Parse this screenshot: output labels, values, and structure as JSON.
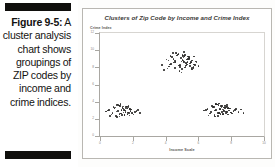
{
  "figure": {
    "label": "Figure 9-5:",
    "caption": "A cluster analysis chart shows groupings of ZIP codes by income and crime indices."
  },
  "colors": {
    "rule": "#100f0d",
    "point": "#2b2a28",
    "axis": "#a9a7a2",
    "panel_border": "#b9b7b2",
    "title_text": "#3b3a38",
    "tick_text": "#8a8884"
  },
  "chart_data": {
    "type": "scatter",
    "title": "Clusters of Zip Code by Income and Crime Index",
    "xlabel": "Income Scale",
    "ylabel": "Crime Index",
    "grid": false,
    "legend": "none",
    "xlim": [
      0,
      10
    ],
    "ylim": [
      0,
      12
    ],
    "xticks": [
      0,
      2,
      4,
      6,
      8,
      10
    ],
    "yticks": [
      0,
      2,
      4,
      6,
      8,
      10,
      12
    ],
    "xticklabels": [
      "0",
      "2",
      "4",
      "6",
      "8",
      "10"
    ],
    "yticklabels": [
      "0",
      "2",
      "4",
      "6",
      "8",
      "10",
      "12"
    ],
    "series": [
      {
        "name": "Cluster A (high crime, mid income)",
        "x": [
          4.05,
          4.3,
          4.52,
          4.66,
          4.8,
          4.95,
          5.08,
          5.2,
          5.32,
          5.44,
          4.2,
          4.4,
          4.6,
          4.74,
          4.88,
          5.02,
          5.16,
          5.28,
          5.4,
          5.54,
          4.12,
          4.48,
          4.7,
          4.84,
          4.98,
          5.1,
          5.24,
          5.36,
          5.48,
          5.62,
          4.34,
          4.56,
          4.78,
          4.92,
          5.06,
          5.18,
          5.3,
          5.42,
          5.56,
          5.7,
          3.9,
          4.26,
          4.64,
          5.0,
          5.12,
          5.26,
          5.38,
          5.5,
          5.66,
          5.8,
          4.44,
          4.58,
          4.86,
          5.04,
          5.22,
          5.34,
          5.46,
          5.6,
          5.74,
          5.88,
          3.78,
          4.18,
          4.96,
          5.14,
          5.58,
          5.72,
          5.84,
          6.0
        ],
        "y": [
          8.9,
          9.35,
          8.55,
          9.6,
          8.2,
          9.1,
          8.75,
          9.45,
          8.35,
          9.0,
          8.1,
          9.2,
          8.6,
          9.5,
          8.05,
          8.85,
          9.3,
          8.45,
          9.05,
          8.65,
          7.85,
          8.95,
          9.4,
          8.25,
          8.7,
          9.15,
          8.5,
          9.25,
          8.15,
          8.8,
          8.4,
          7.95,
          9.55,
          8.3,
          9.35,
          8.0,
          8.9,
          9.2,
          8.55,
          8.05,
          7.7,
          8.35,
          9.65,
          7.8,
          8.6,
          8.2,
          9.0,
          8.45,
          7.9,
          8.25,
          9.7,
          8.75,
          7.6,
          9.45,
          8.1,
          8.65,
          9.1,
          7.75,
          8.35,
          8.55,
          8.3,
          8.8,
          7.4,
          9.8,
          7.95,
          9.25,
          8.7,
          8.15
        ]
      },
      {
        "name": "Cluster B (low income, low crime)",
        "x": [
          0.55,
          0.82,
          1.0,
          1.15,
          1.28,
          1.4,
          1.52,
          1.64,
          1.76,
          1.88,
          0.7,
          0.94,
          1.08,
          1.22,
          1.34,
          1.46,
          1.58,
          1.7,
          1.82,
          1.95,
          0.62,
          0.88,
          1.04,
          1.18,
          1.3,
          1.43,
          1.55,
          1.67,
          1.79,
          1.92,
          0.76,
          0.98,
          1.12,
          1.25,
          1.37,
          1.49,
          1.61,
          1.73,
          1.85,
          2.05,
          0.48,
          1.06,
          1.2,
          1.32,
          1.44,
          1.56,
          1.68,
          1.8,
          2.15,
          2.3,
          0.35,
          1.02,
          1.26,
          1.5,
          1.74,
          1.98,
          2.22,
          2.45
        ],
        "y": [
          3.05,
          3.4,
          2.85,
          3.55,
          2.6,
          3.2,
          2.95,
          3.45,
          2.7,
          3.1,
          2.5,
          3.3,
          2.9,
          3.5,
          2.45,
          3.0,
          3.35,
          2.75,
          3.15,
          2.65,
          2.3,
          3.25,
          3.6,
          2.55,
          2.98,
          3.42,
          2.8,
          3.28,
          2.4,
          3.08,
          2.68,
          2.35,
          3.58,
          2.6,
          3.38,
          2.48,
          3.18,
          3.48,
          2.88,
          2.52,
          2.95,
          3.65,
          2.25,
          3.02,
          2.72,
          3.22,
          2.58,
          3.12,
          2.78,
          3.05,
          2.85,
          2.18,
          3.7,
          2.42,
          3.32,
          2.62,
          2.92,
          2.7
        ]
      },
      {
        "name": "Cluster C (high income, low crime)",
        "x": [
          6.55,
          6.82,
          7.0,
          7.15,
          7.28,
          7.4,
          7.52,
          7.64,
          7.76,
          7.88,
          6.7,
          6.94,
          7.08,
          7.22,
          7.34,
          7.46,
          7.58,
          7.7,
          7.82,
          7.95,
          6.62,
          6.88,
          7.04,
          7.18,
          7.3,
          7.43,
          7.55,
          7.67,
          7.79,
          7.92,
          6.76,
          6.98,
          7.12,
          7.25,
          7.37,
          7.49,
          7.61,
          7.73,
          7.85,
          8.05,
          6.45,
          7.06,
          7.2,
          7.32,
          7.44,
          7.56,
          7.68,
          7.8,
          8.15,
          8.3,
          6.35,
          7.02,
          7.26,
          7.5,
          7.74,
          7.98,
          8.22,
          8.45,
          8.6,
          8.75
        ],
        "y": [
          3.15,
          3.5,
          2.95,
          3.65,
          2.7,
          3.3,
          3.05,
          3.55,
          2.8,
          3.2,
          2.6,
          3.4,
          3.0,
          3.6,
          2.55,
          3.1,
          3.45,
          2.85,
          3.25,
          2.75,
          2.4,
          3.35,
          3.7,
          2.65,
          3.08,
          3.52,
          2.9,
          3.38,
          2.5,
          3.18,
          2.78,
          2.45,
          3.68,
          2.7,
          3.48,
          2.58,
          3.28,
          3.58,
          2.98,
          2.62,
          3.05,
          3.75,
          2.35,
          3.12,
          2.82,
          3.32,
          2.68,
          3.22,
          2.88,
          3.15,
          2.95,
          2.28,
          3.8,
          2.52,
          3.42,
          2.72,
          3.02,
          2.8,
          3.1,
          2.66
        ]
      }
    ]
  }
}
